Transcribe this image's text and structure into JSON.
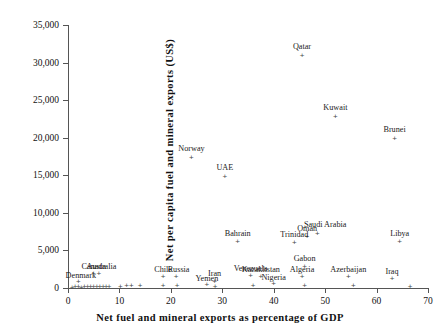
{
  "chart_data": {
    "type": "scatter",
    "title": "",
    "xlabel": "Net fuel and mineral exports as percentage of GDP",
    "ylabel": "Net per capita fuel and mineral exports (US$)",
    "xlim": [
      0,
      70
    ],
    "ylim": [
      0,
      35000
    ],
    "xticks": [
      0,
      10,
      20,
      30,
      40,
      50,
      60,
      70
    ],
    "xticklabels": [
      "0",
      "10",
      "20",
      "30",
      "40",
      "50",
      "60",
      "70"
    ],
    "yticks": [
      0,
      5000,
      10000,
      15000,
      20000,
      25000,
      30000,
      35000
    ],
    "yticklabels": [
      "0",
      "5,000",
      "10,000",
      "15,000",
      "20,000",
      "25,000",
      "30,000",
      "35,000"
    ],
    "grid": false,
    "legend": null,
    "marker": "plus",
    "marker_color": "#4a4a4a",
    "points": [
      {
        "label": "Qatar",
        "x": 45.5,
        "y": 31000,
        "lx": 45.5,
        "ly": 32000
      },
      {
        "label": "Kuwait",
        "x": 52.0,
        "y": 22800,
        "lx": 52.0,
        "ly": 23800
      },
      {
        "label": "Brunei",
        "x": 63.5,
        "y": 19900,
        "lx": 63.5,
        "ly": 20900
      },
      {
        "label": "Norway",
        "x": 24.0,
        "y": 17400,
        "lx": 24.0,
        "ly": 18400
      },
      {
        "label": "UAE",
        "x": 30.5,
        "y": 14900,
        "lx": 30.5,
        "ly": 15900
      },
      {
        "label": "Saudi Arabia",
        "x": 48.5,
        "y": 7300,
        "lx": 50.0,
        "ly": 8300
      },
      {
        "label": "Oman",
        "x": 46.5,
        "y": 6800,
        "lx": 46.5,
        "ly": 7700
      },
      {
        "label": "Bahrain",
        "x": 33.0,
        "y": 6200,
        "lx": 33.0,
        "ly": 7100
      },
      {
        "label": "Trinidad",
        "x": 44.0,
        "y": 6100,
        "lx": 44.0,
        "ly": 6900
      },
      {
        "label": "Libya",
        "x": 64.5,
        "y": 6200,
        "lx": 64.5,
        "ly": 7100
      },
      {
        "label": "Gabon",
        "x": 46.0,
        "y": 2900,
        "lx": 46.0,
        "ly": 3700
      },
      {
        "label": "Algeria",
        "x": 45.5,
        "y": 1500,
        "lx": 45.5,
        "ly": 2300
      },
      {
        "label": "Azerbaijan",
        "x": 54.5,
        "y": 1500,
        "lx": 54.5,
        "ly": 2300
      },
      {
        "label": "Iraq",
        "x": 63.0,
        "y": 1200,
        "lx": 63.0,
        "ly": 2000
      },
      {
        "label": "Venezuela",
        "x": 35.5,
        "y": 1700,
        "lx": 35.5,
        "ly": 2400
      },
      {
        "label": "Kazakhstan",
        "x": 37.5,
        "y": 1500,
        "lx": 37.5,
        "ly": 2200
      },
      {
        "label": "Nigeria",
        "x": 40.0,
        "y": 600,
        "lx": 40.0,
        "ly": 1200
      },
      {
        "label": "Iran",
        "x": 28.5,
        "y": 900,
        "lx": 28.5,
        "ly": 1700
      },
      {
        "label": "Yemen",
        "x": 27.0,
        "y": 500,
        "lx": 27.0,
        "ly": 1000
      },
      {
        "label": "Russia",
        "x": 21.0,
        "y": 1500,
        "lx": 21.5,
        "ly": 2300
      },
      {
        "label": "Chile",
        "x": 18.5,
        "y": 1500,
        "lx": 18.5,
        "ly": 2300
      },
      {
        "label": "Australia",
        "x": 6.0,
        "y": 1900,
        "lx": 6.5,
        "ly": 2700
      },
      {
        "label": "Canada",
        "x": 5.0,
        "y": 1900,
        "lx": 5.0,
        "ly": 2700
      },
      {
        "label": "Denmark",
        "x": 2.0,
        "y": 800,
        "lx": 2.5,
        "ly": 1500
      }
    ],
    "unlabeled_points": [
      {
        "x": 0.8,
        "y": 120
      },
      {
        "x": 1.4,
        "y": 150
      },
      {
        "x": 2.0,
        "y": 180
      },
      {
        "x": 2.6,
        "y": 130
      },
      {
        "x": 3.2,
        "y": 200
      },
      {
        "x": 3.8,
        "y": 160
      },
      {
        "x": 4.4,
        "y": 240
      },
      {
        "x": 5.0,
        "y": 190
      },
      {
        "x": 5.6,
        "y": 150
      },
      {
        "x": 6.2,
        "y": 220
      },
      {
        "x": 6.8,
        "y": 170
      },
      {
        "x": 7.4,
        "y": 140
      },
      {
        "x": 8.0,
        "y": 200
      },
      {
        "x": 10.2,
        "y": 260
      },
      {
        "x": 11.4,
        "y": 300
      },
      {
        "x": 12.3,
        "y": 280
      },
      {
        "x": 14.0,
        "y": 320
      },
      {
        "x": 18.5,
        "y": 300
      },
      {
        "x": 21.2,
        "y": 340
      },
      {
        "x": 28.6,
        "y": 260
      },
      {
        "x": 36.0,
        "y": 300
      },
      {
        "x": 46.0,
        "y": 280
      },
      {
        "x": 55.5,
        "y": 300
      },
      {
        "x": 66.5,
        "y": 260
      }
    ]
  }
}
